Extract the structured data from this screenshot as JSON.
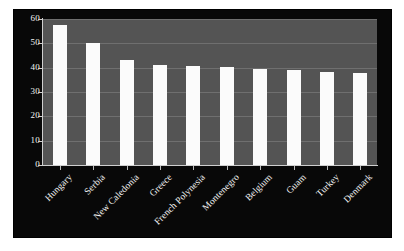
{
  "chart_data": {
    "type": "bar",
    "title": "",
    "subtitle": "",
    "xlabel": "",
    "ylabel": "",
    "categories": [
      "Hungary",
      "Serbia",
      "New Caledonia",
      "Greece",
      "French Polynesia",
      "Montenegro",
      "Belgium",
      "Guam",
      "Turkey",
      "Denmark"
    ],
    "values": [
      57.5,
      50,
      43,
      41,
      40.5,
      40.3,
      39.5,
      39,
      38.3,
      38
    ],
    "ylim": [
      0,
      60
    ],
    "yticks": [
      0,
      10,
      20,
      30,
      40,
      50,
      60
    ],
    "ytick_labels": [
      "0",
      "10",
      "20",
      "30",
      "40",
      "50",
      "60"
    ],
    "grid": true,
    "grid_axis": "y",
    "legend": false,
    "legend_position": "none",
    "bar_color": "#fbfbfb",
    "plot_background": "#545454",
    "figure_background": "#080808",
    "outer_background": "#ffffff",
    "axis_color": "#cfcfcf",
    "gridline_color": "#6f6f6f",
    "text_color": "#f4f4f4",
    "label_rotation": -45
  }
}
